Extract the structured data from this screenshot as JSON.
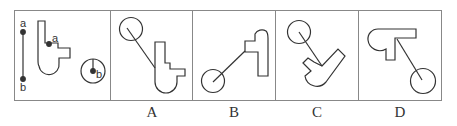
{
  "figure": {
    "type": "spatial-reasoning-puzzle",
    "question_panel": {
      "segment_labels": [
        "a",
        "b"
      ],
      "shape_point_label": "a",
      "circle_point_label": "b"
    },
    "options": [
      {
        "label": "A"
      },
      {
        "label": "B"
      },
      {
        "label": "C"
      },
      {
        "label": "D"
      }
    ],
    "colors": {
      "stroke": "#333333",
      "border": "#888888",
      "background": "#ffffff"
    }
  }
}
